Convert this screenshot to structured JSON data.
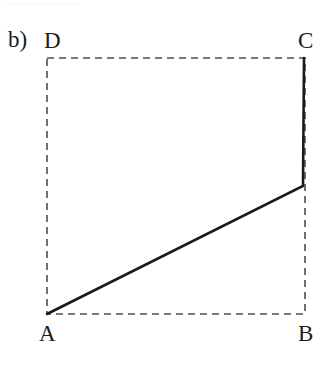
{
  "figure": {
    "panel_tag": "b)",
    "caption": "",
    "background_color": "#ffffff",
    "width": 330,
    "height": 373
  },
  "chart_data": {
    "type": "diagram",
    "title": "",
    "subtitle": "",
    "xlabel": "",
    "ylabel": "",
    "grid": false,
    "legend": "none",
    "vertices": [
      {
        "id": "A",
        "label": "A",
        "x": 47,
        "y": 314,
        "label_x": 46,
        "label_y": 336
      },
      {
        "id": "B",
        "label": "B",
        "x": 305,
        "y": 314,
        "label_x": 306,
        "label_y": 336
      },
      {
        "id": "C",
        "label": "C",
        "x": 305,
        "y": 58,
        "label_x": 306,
        "label_y": 41
      },
      {
        "id": "D",
        "label": "D",
        "x": 47,
        "y": 58,
        "label_x": 50,
        "label_y": 41
      }
    ],
    "dashed_rectangle": {
      "points": "47,58 305,58 305,314 47,314",
      "stroke": "#4d4d4d",
      "stroke_width": 1.6,
      "dash": "7 5",
      "closed": true
    },
    "solid_path": {
      "points": "47,314 303,186 304,58",
      "stroke": "#1a1a1a",
      "stroke_width": 2.6,
      "kink": {
        "x": 303,
        "y": 186
      }
    },
    "axis_ranges": {
      "x": [
        47,
        305
      ],
      "y": [
        58,
        314
      ]
    }
  },
  "labels": {
    "panel": "b)",
    "A": "A",
    "B": "B",
    "C": "C",
    "D": "D"
  },
  "colors": {
    "solid_line": "#1a1a1a",
    "dashed_line": "#4d4d4d",
    "text": "#1c1c1c",
    "background": "#ffffff"
  }
}
